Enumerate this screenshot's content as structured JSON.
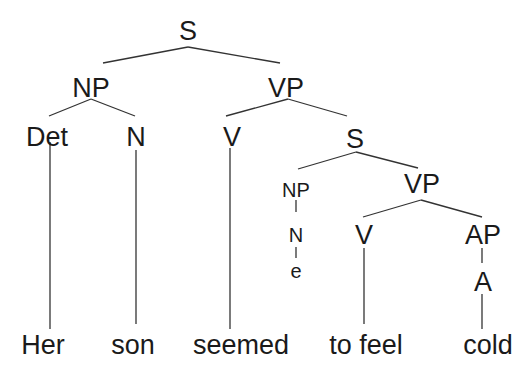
{
  "diagram": {
    "type": "syntax-tree",
    "sentence": "Her son seemed to feel cold",
    "nodes": {
      "root_s": "S",
      "np_subject": "NP",
      "vp_main": "VP",
      "det": "Det",
      "n_subject": "N",
      "v_main": "V",
      "s_embedded": "S",
      "np_empty": "NP",
      "n_empty": "N",
      "empty_e": "e",
      "vp_embedded": "VP",
      "v_embedded": "V",
      "ap": "AP",
      "a": "A"
    },
    "words": {
      "her": "Her",
      "son": "son",
      "seemed": "seemed",
      "to_feel": "to feel",
      "cold": "cold"
    },
    "colors": {
      "text": "#1a1a1a",
      "lines": "#333333",
      "background": "#ffffff"
    }
  }
}
